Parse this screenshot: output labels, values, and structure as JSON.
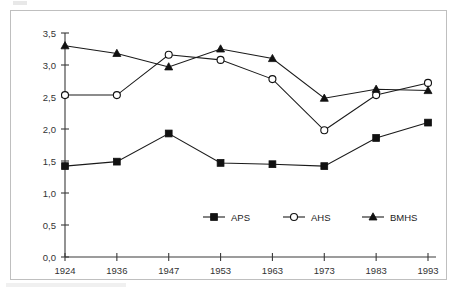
{
  "chart_data": {
    "type": "line",
    "title": "",
    "subtitle": "",
    "xlabel": "",
    "ylabel": "",
    "categories": [
      "1924",
      "1936",
      "1947",
      "1953",
      "1963",
      "1973",
      "1983",
      "1993"
    ],
    "ylim": [
      0.0,
      3.5
    ],
    "ytick_labels": [
      "0,0",
      "0,5",
      "1,0",
      "1,5",
      "2,0",
      "2,5",
      "3,0",
      "3,5"
    ],
    "ytick_values": [
      0.0,
      0.5,
      1.0,
      1.5,
      2.0,
      2.5,
      3.0,
      3.5
    ],
    "decimal_separator": ",",
    "grid": false,
    "legend_position": "inside-bottom-center",
    "series": [
      {
        "name": "APS",
        "marker": "filled-square",
        "color": "#111111",
        "values": [
          1.42,
          1.49,
          1.93,
          1.47,
          1.45,
          1.42,
          1.86,
          2.1
        ]
      },
      {
        "name": "AHS",
        "marker": "open-circle",
        "color": "#111111",
        "values": [
          2.53,
          2.53,
          3.16,
          3.08,
          2.78,
          1.98,
          2.53,
          2.72
        ]
      },
      {
        "name": "BMHS",
        "marker": "filled-triangle",
        "color": "#111111",
        "values": [
          3.3,
          3.18,
          2.97,
          3.25,
          3.1,
          2.48,
          2.62,
          2.6
        ]
      }
    ]
  },
  "frame": {
    "border_color": "#bfbfbf",
    "background": "#ffffff"
  }
}
